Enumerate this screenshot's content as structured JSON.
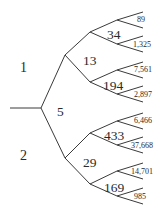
{
  "diagram": {
    "type": "binary-tree",
    "edge_labels_level1": {
      "upper": "1",
      "lower": "2"
    },
    "root_node": "5",
    "level2": [
      {
        "label": "13",
        "children": [
          {
            "label": "34",
            "leaves": [
              "89",
              "1,325"
            ]
          },
          {
            "label": "194",
            "leaves": [
              "7,561",
              "2,897"
            ]
          }
        ]
      },
      {
        "label": "29",
        "children": [
          {
            "label": "433",
            "leaves": [
              "6,466",
              "37,668"
            ]
          },
          {
            "label": "169",
            "leaves": [
              "14,701",
              "985"
            ]
          }
        ]
      }
    ]
  },
  "colors": {
    "line": "#3a3a3a",
    "text": "#2a2a2a",
    "background": "#ffffff"
  }
}
